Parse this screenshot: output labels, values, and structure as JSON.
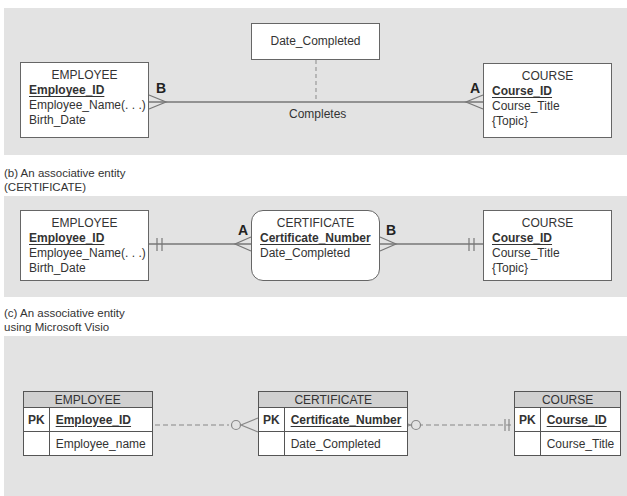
{
  "panels": {
    "a": {
      "relationship_attribute": "Date_Completed",
      "relationship_name": "Completes",
      "label_left": "B",
      "label_right": "A",
      "employee": {
        "title": "EMPLOYEE",
        "pk": "Employee_ID",
        "attrs": [
          "Employee_Name(. . .)",
          "Birth_Date"
        ]
      },
      "course": {
        "title": "COURSE",
        "pk": "Course_ID",
        "attrs": [
          "Course_Title",
          "{Topic}"
        ]
      }
    },
    "b": {
      "caption_line1": "(b) An associative entity",
      "caption_line2": "(CERTIFICATE)",
      "label_left": "A",
      "label_right": "B",
      "employee": {
        "title": "EMPLOYEE",
        "pk": "Employee_ID",
        "attrs": [
          "Employee_Name(. . .)",
          "Birth_Date"
        ]
      },
      "certificate": {
        "title": "CERTIFICATE",
        "pk": "Certificate_Number",
        "attrs": [
          "Date_Completed"
        ]
      },
      "course": {
        "title": "COURSE",
        "pk": "Course_ID",
        "attrs": [
          "Course_Title",
          "{Topic}"
        ]
      }
    },
    "c": {
      "caption_line1": "(c) An associative entity",
      "caption_line2": "using Microsoft Visio",
      "pk_marker": "PK",
      "employee": {
        "title": "EMPLOYEE",
        "pk": "Employee_ID",
        "attr": "Employee_name"
      },
      "certificate": {
        "title": "CERTIFICATE",
        "pk": "Certificate_Number",
        "attr": "Date_Completed"
      },
      "course": {
        "title": "COURSE",
        "pk": "Course_ID",
        "attr": "Course_Title"
      }
    }
  },
  "colors": {
    "panel_bg": "#e3e3e3",
    "line": "#777777",
    "box_border": "#666666",
    "visio_header": "#d0d0d0"
  }
}
